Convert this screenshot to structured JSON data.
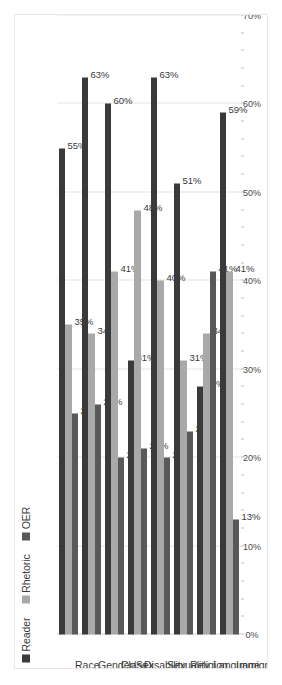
{
  "chart_data": {
    "type": "bar",
    "orientation": "horizontal",
    "title": "",
    "subtitle": "",
    "xlabel": "",
    "ylabel": "",
    "grid": true,
    "legend_position": "top-left",
    "value_suffix": "%",
    "axis": {
      "min": 0,
      "max": 70,
      "major_step": 10,
      "minor_step": 2,
      "tick_labels": [
        "70%",
        "60%",
        "50%",
        "40%",
        "30%",
        "20%",
        "10%",
        "0%"
      ],
      "tick_values": [
        70,
        60,
        50,
        40,
        30,
        20,
        10,
        0
      ]
    },
    "categories": [
      "Race",
      "Gender/Sex",
      "Class",
      "Disability",
      "Sexuality",
      "Religion",
      "Language",
      "Immigration"
    ],
    "series": [
      {
        "name": "Reader",
        "color": "#3a3a3a",
        "values": [
          55,
          63,
          60,
          31,
          63,
          51,
          28,
          59
        ],
        "labels": [
          "55%",
          "63%",
          "60%",
          "31%",
          "63%",
          "51%",
          "28%",
          "59%"
        ]
      },
      {
        "name": "Rhetoric",
        "color": "#a9a9a9",
        "values": [
          35,
          34,
          41,
          48,
          40,
          31,
          34,
          41
        ],
        "labels": [
          "35%",
          "34%",
          "41%",
          "48%",
          "40%",
          "31%",
          "34%",
          "41%"
        ]
      },
      {
        "name": "OER",
        "color": "#595959",
        "values": [
          25,
          26,
          20,
          21,
          20,
          23,
          41,
          13
        ],
        "labels": [
          "25%",
          "26%",
          "20%",
          "21%",
          "20%",
          "23%",
          "41%",
          "13%"
        ]
      }
    ]
  },
  "legend": {
    "items": [
      {
        "label": "Reader",
        "color": "#3a3a3a"
      },
      {
        "label": "Rhetoric",
        "color": "#a9a9a9"
      },
      {
        "label": "OER",
        "color": "#595959"
      }
    ]
  },
  "colors": {
    "background": "#ffffff",
    "frame_border": "#e8e8e8",
    "gridline": "#e4e4e4",
    "text": "#3b3b3b"
  }
}
